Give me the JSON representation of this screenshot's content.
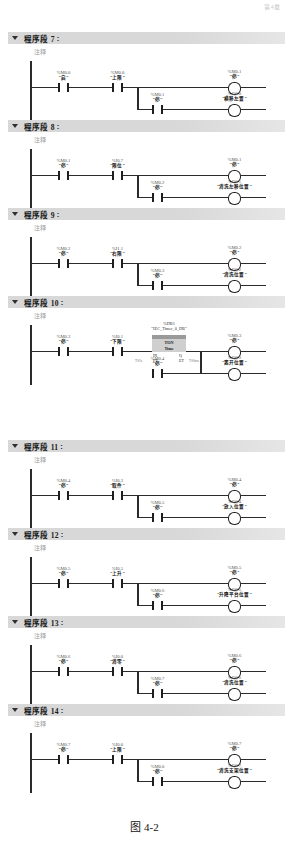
{
  "page": {
    "running_header": "第4章",
    "figure_caption": "图 4-2"
  },
  "labels": {
    "collapse_icon": "collapse-triangle",
    "colon": ":",
    "comment_placeholder": "注释",
    "coil_normal": "",
    "coil_set": "S",
    "coil_reset": "R"
  },
  "networks": [
    {
      "id": "nw7",
      "title": "程序段 7",
      "comment": "注释",
      "branches": [
        {
          "type": "main",
          "contacts": [
            {
              "addr": "%M0.0",
              "tag": "\"启\""
            },
            {
              "addr": "%M0.0",
              "tag": "\"上限\""
            }
          ],
          "coil": {
            "addr": "%M0.1",
            "tag": "\"停\"",
            "letter": ""
          }
        },
        {
          "type": "branch",
          "contacts": [
            {
              "addr": "%M0.1",
              "tag": "\"停\"",
              "style": "S"
            }
          ],
          "coil": {
            "addr": "%Q0.0",
            "tag": "\"横移左置\"",
            "letter": ""
          }
        }
      ]
    },
    {
      "id": "nw8",
      "title": "程序段 8",
      "comment": "注释",
      "branches": [
        {
          "type": "main",
          "contacts": [
            {
              "addr": "%M0.1",
              "tag": "\"停\""
            },
            {
              "addr": "%I0.7",
              "tag": "\"限位\""
            }
          ],
          "coil": {
            "addr": "%M0.1",
            "tag": "\"停\"",
            "letter": ""
          }
        },
        {
          "type": "branch",
          "contacts": [
            {
              "addr": "%M0.2",
              "tag": "\"停\"",
              "style": "S"
            }
          ],
          "coil": {
            "addr": "%Q0.1",
            "tag": "\"清洗左移位置\"",
            "letter": ""
          }
        }
      ]
    },
    {
      "id": "nw9",
      "title": "程序段 9",
      "comment": "注释",
      "branches": [
        {
          "type": "main",
          "contacts": [
            {
              "addr": "%M0.2",
              "tag": "\"停\""
            },
            {
              "addr": "%I1.1",
              "tag": "\"右限\""
            }
          ],
          "coil": {
            "addr": "%M0.2",
            "tag": "\"停\"",
            "letter": ""
          }
        },
        {
          "type": "branch",
          "contacts": [
            {
              "addr": "%M0.3",
              "tag": "\"停\"",
              "style": "S"
            }
          ],
          "coil": {
            "addr": "%Q0.2",
            "tag": "\"清洗位置\"",
            "letter": ""
          }
        }
      ]
    },
    {
      "id": "nw10",
      "title": "程序段 10",
      "comment": "注释",
      "branches": [
        {
          "type": "main-timer",
          "contacts": [
            {
              "addr": "%M0.3",
              "tag": "\"停\""
            },
            {
              "addr": "%I0.1",
              "tag": "\"下限\""
            }
          ],
          "timer": {
            "instance": "%DB1",
            "name": "\"IEC_Timer_0_DB\"",
            "block": "TON",
            "type": "Time",
            "pin_in": "IN",
            "pin_q": "Q",
            "pin_pt": "PT",
            "pin_et": "ET",
            "pt_value": "T#2s",
            "et_value": "T#0ms"
          },
          "coil": {
            "addr": "%M0.3",
            "tag": "\"停\"",
            "letter": ""
          }
        },
        {
          "type": "branch",
          "contacts": [
            {
              "addr": "%M0.4",
              "tag": "\"停\"",
              "style": "S"
            }
          ],
          "coil": {
            "addr": "%Q0.3",
            "tag": "\"离开位置\"",
            "letter": ""
          }
        }
      ]
    },
    {
      "id": "nw11",
      "title": "程序段 11",
      "comment": "注释",
      "branches": [
        {
          "type": "main",
          "contacts": [
            {
              "addr": "%M0.4",
              "tag": "\"停\""
            },
            {
              "addr": "%I0.3",
              "tag": "\"取件\""
            }
          ],
          "coil": {
            "addr": "%M0.4",
            "tag": "\"停\"",
            "letter": ""
          }
        },
        {
          "type": "branch",
          "contacts": [
            {
              "addr": "%M0.5",
              "tag": "\"停\"",
              "style": "S"
            }
          ],
          "coil": {
            "addr": "%Q0.4",
            "tag": "\"放入位置\"",
            "letter": ""
          }
        }
      ]
    },
    {
      "id": "nw12",
      "title": "程序段 12",
      "comment": "注释",
      "branches": [
        {
          "type": "main",
          "contacts": [
            {
              "addr": "%M0.5",
              "tag": "\"停\""
            },
            {
              "addr": "%I0.5",
              "tag": "\"上升\""
            }
          ],
          "coil": {
            "addr": "%M0.5",
            "tag": "\"停\"",
            "letter": ""
          }
        },
        {
          "type": "branch",
          "contacts": [
            {
              "addr": "%M0.6",
              "tag": "\"停\"",
              "style": "S"
            }
          ],
          "coil": {
            "addr": "%Q0.5",
            "tag": "\"升降平台位置\"",
            "letter": ""
          }
        }
      ]
    },
    {
      "id": "nw13",
      "title": "程序段 13",
      "comment": "注释",
      "branches": [
        {
          "type": "main",
          "contacts": [
            {
              "addr": "%M0.6",
              "tag": "\"停\""
            },
            {
              "addr": "%I0.0",
              "tag": "\"清零\""
            }
          ],
          "coil": {
            "addr": "%M0.6",
            "tag": "\"停\"",
            "letter": ""
          }
        },
        {
          "type": "branch",
          "contacts": [
            {
              "addr": "%M0.7",
              "tag": "\"停\"",
              "style": "S"
            }
          ],
          "coil": {
            "addr": "%Q0.6",
            "tag": "\"清洗位置\"",
            "letter": ""
          }
        }
      ]
    },
    {
      "id": "nw14",
      "title": "程序段 14",
      "comment": "注释",
      "branches": [
        {
          "type": "main",
          "contacts": [
            {
              "addr": "%M0.7",
              "tag": "\"停\""
            },
            {
              "addr": "%I0.0",
              "tag": "\"上限\""
            }
          ],
          "coil": {
            "addr": "%M0.7",
            "tag": "\"停\"",
            "letter": ""
          }
        },
        {
          "type": "branch",
          "contacts": [
            {
              "addr": "%M0.0",
              "tag": "\"停\"",
              "style": "S"
            }
          ],
          "coil": {
            "addr": "%Q0.7",
            "tag": "\"清洗支架位置\"",
            "letter": ""
          }
        }
      ]
    }
  ]
}
